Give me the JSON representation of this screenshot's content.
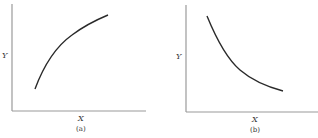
{
  "panels": [
    {
      "caption": "(a)",
      "x_label": "X",
      "y_label": "Y",
      "curve": "increasing, concave (diminishing returns)"
    },
    {
      "caption": "(b)",
      "x_label": "X",
      "y_label": "Y",
      "curve": "decreasing, convex"
    }
  ],
  "colors": {
    "axis": "#9a9a9a",
    "curve": "#2a2a2a",
    "background": "#ffffff"
  }
}
